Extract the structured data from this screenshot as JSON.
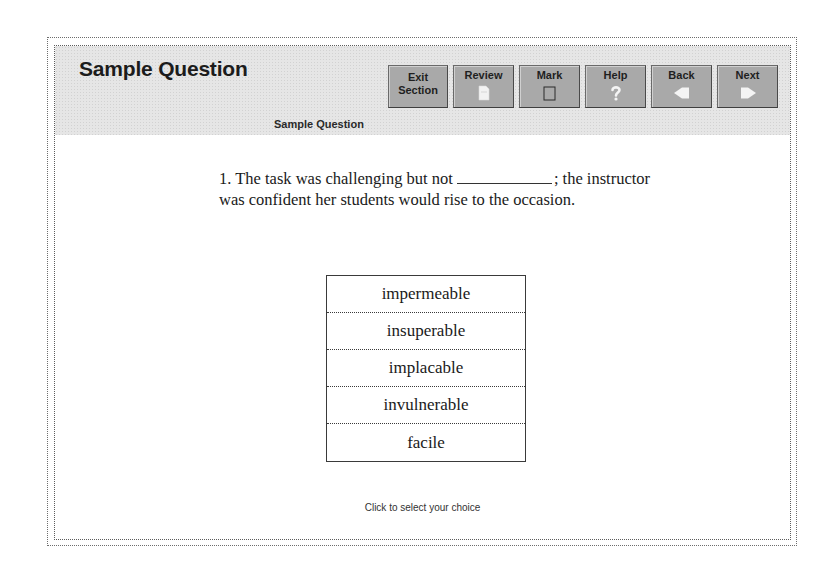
{
  "header": {
    "title": "Sample Question",
    "subtitle": "Sample Question"
  },
  "toolbar": {
    "buttons": [
      {
        "id": "exit-section",
        "label_line1": "Exit",
        "label_line2": "Section",
        "icon": "none"
      },
      {
        "id": "review",
        "label": "Review",
        "icon": "document-icon"
      },
      {
        "id": "mark",
        "label": "Mark",
        "icon": "checkbox-icon"
      },
      {
        "id": "help",
        "label": "Help",
        "icon": "question-mark-icon"
      },
      {
        "id": "back",
        "label": "Back",
        "icon": "arrow-left-icon"
      },
      {
        "id": "next",
        "label": "Next",
        "icon": "arrow-right-icon"
      }
    ]
  },
  "question": {
    "number": "1.",
    "text_before_blank": "The task was challenging but not",
    "text_after_blank": "; the instructor was confident her students would rise to the occasion."
  },
  "choices": [
    "impermeable",
    "insuperable",
    "implacable",
    "invulnerable",
    "facile"
  ],
  "footer": {
    "hint": "Click to select your choice"
  },
  "colors": {
    "header_bg": "#e6e6e6",
    "button_bg": "#b4b4b4",
    "text": "#1a1a1a",
    "icon": "#f4f4f4"
  }
}
